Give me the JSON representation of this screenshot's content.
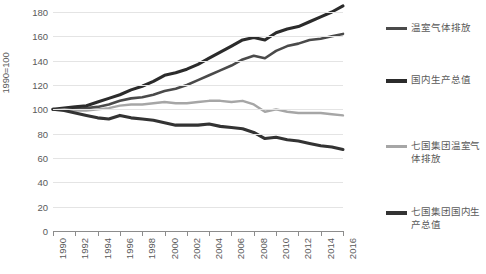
{
  "chart_data": {
    "type": "line",
    "title": "",
    "subtitle": "",
    "xlabel": "",
    "ylabel": "1990=100",
    "xlim": [
      1990,
      2016
    ],
    "ylim": [
      0,
      180
    ],
    "grid": true,
    "legend_position": "right",
    "y_ticks": [
      0,
      20,
      40,
      60,
      80,
      100,
      120,
      140,
      160,
      180
    ],
    "x_ticks": [
      1990,
      1992,
      1994,
      1996,
      1998,
      2000,
      2002,
      2004,
      2006,
      2008,
      2010,
      2012,
      2014,
      2016
    ],
    "x": [
      1990,
      1991,
      1992,
      1993,
      1994,
      1995,
      1996,
      1997,
      1998,
      1999,
      2000,
      2001,
      2002,
      2003,
      2004,
      2005,
      2006,
      2007,
      2008,
      2009,
      2010,
      2011,
      2012,
      2013,
      2014,
      2015,
      2016
    ],
    "series": [
      {
        "name": "温室气体排放",
        "color": "#4a4a4a",
        "values": [
          100,
          100,
          100,
          101,
          102,
          104,
          107,
          109,
          110,
          112,
          115,
          117,
          120,
          124,
          128,
          132,
          136,
          141,
          144,
          142,
          148,
          152,
          154,
          157,
          158,
          160,
          162
        ]
      },
      {
        "name": "国内生产总值",
        "color": "#2b2b2b",
        "values": [
          100,
          101,
          102,
          103,
          106,
          109,
          112,
          116,
          119,
          123,
          128,
          130,
          133,
          137,
          142,
          147,
          152,
          157,
          159,
          157,
          163,
          166,
          168,
          172,
          176,
          180,
          185
        ]
      },
      {
        "name": "七国集团温室气体排放",
        "color": "#a6a6a6",
        "values": [
          100,
          100,
          99,
          99,
          100,
          101,
          103,
          104,
          104,
          105,
          106,
          105,
          105,
          106,
          107,
          107,
          106,
          107,
          104,
          98,
          100,
          98,
          97,
          97,
          97,
          96,
          95
        ]
      },
      {
        "name": "七国集团国内生产总值",
        "color": "#333333",
        "values": [
          100,
          99,
          97,
          95,
          93,
          92,
          95,
          93,
          92,
          91,
          89,
          87,
          87,
          87,
          88,
          86,
          85,
          84,
          81,
          76,
          77,
          75,
          74,
          72,
          70,
          69,
          67
        ]
      }
    ]
  },
  "axis": {
    "y_title": "1990=100"
  },
  "legend": {
    "items": [
      {
        "label": "温室气体排放",
        "color": "#4a4a4a",
        "width": 3
      },
      {
        "label": "国内生产总值",
        "color": "#2b2b2b",
        "width": 4
      },
      {
        "label": "七国集团温室气体排放",
        "color": "#a6a6a6",
        "width": 3
      },
      {
        "label": "七国集团国内生产总值",
        "color": "#333333",
        "width": 4
      }
    ]
  }
}
